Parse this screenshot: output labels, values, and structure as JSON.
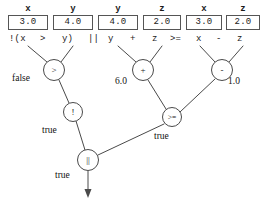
{
  "diagram": {
    "variables": [
      {
        "name": "x",
        "value": "3.0",
        "x": 8,
        "y": 4,
        "w": 40
      },
      {
        "name": "y",
        "value": "4.0",
        "x": 53,
        "y": 4,
        "w": 40
      },
      {
        "name": "y",
        "value": "4.0",
        "x": 98,
        "y": 4,
        "w": 40
      },
      {
        "name": "z",
        "value": "2.0",
        "x": 143,
        "y": 4,
        "w": 38
      },
      {
        "name": "x",
        "value": "3.0",
        "x": 186,
        "y": 4,
        "w": 36
      },
      {
        "name": "z",
        "value": "2.0",
        "x": 226,
        "y": 4,
        "w": 34
      }
    ],
    "expression_tokens": [
      {
        "text": "!(x",
        "x": 9,
        "y": 34
      },
      {
        "text": ">",
        "x": 40,
        "y": 34
      },
      {
        "text": "y)",
        "x": 62,
        "y": 34
      },
      {
        "text": "||",
        "x": 88,
        "y": 34
      },
      {
        "text": "y",
        "x": 108,
        "y": 34
      },
      {
        "text": "+",
        "x": 130,
        "y": 34
      },
      {
        "text": "z",
        "x": 152,
        "y": 34
      },
      {
        "text": ">=",
        "x": 170,
        "y": 34
      },
      {
        "text": "x",
        "x": 196,
        "y": 34
      },
      {
        "text": "-",
        "x": 216,
        "y": 34
      },
      {
        "text": "z",
        "x": 237,
        "y": 34
      }
    ],
    "expression_full": "!(x > y) || y + z >= x - z",
    "nodes": [
      {
        "id": "gt",
        "label": ">",
        "cx": 54,
        "cy": 70,
        "r": 11,
        "size": "normal"
      },
      {
        "id": "add",
        "label": "+",
        "cx": 143,
        "cy": 70,
        "r": 11,
        "size": "normal"
      },
      {
        "id": "sub",
        "label": "-",
        "cx": 222,
        "cy": 70,
        "r": 11,
        "size": "normal"
      },
      {
        "id": "not",
        "label": "!",
        "cx": 73,
        "cy": 112,
        "r": 10,
        "size": "normal"
      },
      {
        "id": "ge",
        "label": ">=",
        "cx": 172,
        "cy": 117,
        "r": 10,
        "size": "small"
      },
      {
        "id": "or",
        "label": "||",
        "cx": 88,
        "cy": 160,
        "r": 11,
        "size": "normal"
      }
    ],
    "edge_labels": [
      {
        "text": "false",
        "x": 12,
        "y": 73
      },
      {
        "text": "6.0",
        "x": 117,
        "y": 78
      },
      {
        "text": "1.0",
        "x": 229,
        "y": 78
      },
      {
        "text": "true",
        "x": 44,
        "y": 127
      },
      {
        "text": "true",
        "x": 155,
        "y": 134
      },
      {
        "text": "true",
        "x": 57,
        "y": 172
      }
    ],
    "stroke_color": "#4a4a4a",
    "text_color": "#1a1a1a"
  }
}
